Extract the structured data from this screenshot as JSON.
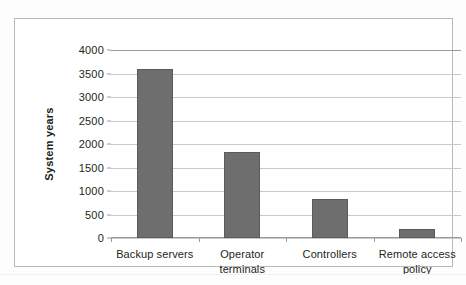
{
  "chart_data": {
    "type": "bar",
    "title": "",
    "xlabel": "",
    "ylabel": "System years",
    "categories": [
      "Backup servers",
      "Operator terminals",
      "Controllers",
      "Remote access policy"
    ],
    "values": [
      3600,
      1820,
      830,
      200
    ],
    "series": [
      {
        "name": "System years",
        "values": [
          3600,
          1820,
          830,
          200
        ]
      }
    ],
    "ylim": [
      0,
      4000
    ],
    "ytick_step": 500,
    "ytick_labels": [
      "4000",
      "3500",
      "3000",
      "2500",
      "2000",
      "1500",
      "1000",
      "500",
      "0"
    ],
    "ytick_values": [
      4000,
      3500,
      3000,
      2500,
      2000,
      1500,
      1000,
      500,
      0
    ],
    "grid": true,
    "legend": false,
    "legend_position": "none",
    "bar_color": "#6e6e6e",
    "gridline_color": "#c9c9c9",
    "axis_color": "#9a9a9a",
    "background_color": "#ffffff"
  },
  "chart": {
    "y_axis_title": "System years"
  }
}
